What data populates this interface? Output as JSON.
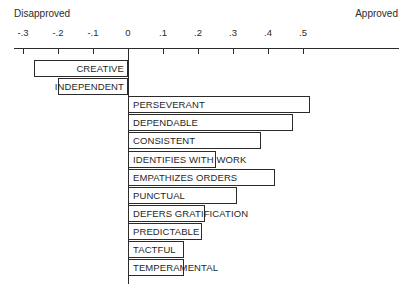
{
  "axis": {
    "left_cap": "Disapproved",
    "right_cap": "Approved",
    "ticks": [
      {
        "value": -0.3,
        "label": "-.3"
      },
      {
        "value": -0.2,
        "label": "-.2"
      },
      {
        "value": -0.1,
        "label": "-.1"
      },
      {
        "value": 0.0,
        "label": "0"
      },
      {
        "value": 0.1,
        "label": ".1"
      },
      {
        "value": 0.2,
        "label": ".2"
      },
      {
        "value": 0.3,
        "label": ".3"
      },
      {
        "value": 0.4,
        "label": ".4"
      },
      {
        "value": 0.5,
        "label": ".5"
      }
    ]
  },
  "chart_data": {
    "type": "bar",
    "orientation": "horizontal",
    "title": "",
    "xlabel": "",
    "ylabel": "",
    "xlim": [
      -0.3,
      0.5
    ],
    "grid": false,
    "legend": false,
    "axis_endpoint_labels": {
      "left": "Disapproved",
      "right": "Approved"
    },
    "xticks": [
      -0.3,
      -0.2,
      -0.1,
      0.0,
      0.1,
      0.2,
      0.3,
      0.4,
      0.5
    ],
    "xticklabels": [
      "-.3",
      "-.2",
      "-.1",
      "0",
      ".1",
      ".2",
      ".3",
      ".4",
      ".5"
    ],
    "categories": [
      "CREATIVE",
      "INDEPENDENT",
      "PERSEVERANT",
      "DEPENDABLE",
      "CONSISTENT",
      "IDENTIFIES WITH WORK",
      "EMPATHIZES ORDERS",
      "PUNCTUAL",
      "DEFERS GRATIFICATION",
      "PREDICTABLE",
      "TACTFUL",
      "TEMPERAMENTAL"
    ],
    "values": [
      -0.27,
      -0.2,
      0.52,
      0.47,
      0.38,
      0.25,
      0.42,
      0.31,
      0.22,
      0.21,
      0.16,
      0.16
    ]
  },
  "bars": [
    {
      "label": "CREATIVE",
      "value": -0.27,
      "side": "neg"
    },
    {
      "label": "INDEPENDENT",
      "value": -0.2,
      "side": "neg"
    },
    {
      "label": "PERSEVERANT",
      "value": 0.52,
      "side": "pos"
    },
    {
      "label": "DEPENDABLE",
      "value": 0.47,
      "side": "pos"
    },
    {
      "label": "CONSISTENT",
      "value": 0.38,
      "side": "pos"
    },
    {
      "label": "IDENTIFIES WITH WORK",
      "value": 0.25,
      "side": "pos"
    },
    {
      "label": "EMPATHIZES ORDERS",
      "value": 0.42,
      "side": "pos"
    },
    {
      "label": "PUNCTUAL",
      "value": 0.31,
      "side": "pos"
    },
    {
      "label": "DEFERS GRATIFICATION",
      "value": 0.22,
      "side": "pos"
    },
    {
      "label": "PREDICTABLE",
      "value": 0.21,
      "side": "pos"
    },
    {
      "label": "TACTFUL",
      "value": 0.16,
      "side": "pos"
    },
    {
      "label": "TEMPERAMENTAL",
      "value": 0.16,
      "side": "pos"
    }
  ],
  "colors": {
    "ink": "#2b2b2b",
    "bar_fill": "#ffffff",
    "bar_stroke": "#2b2b2b",
    "background": "#ffffff"
  }
}
